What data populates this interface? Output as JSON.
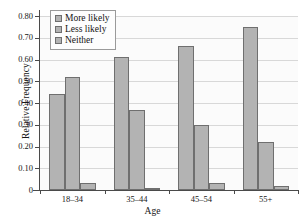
{
  "chart_data": {
    "type": "bar",
    "title": "",
    "xlabel": "Age",
    "ylabel": "Relative Frequency",
    "categories": [
      "18–34",
      "35–44",
      "45–54",
      "55+"
    ],
    "series": [
      {
        "name": "More likely",
        "values": [
          0.44,
          0.61,
          0.66,
          0.75
        ]
      },
      {
        "name": "Less likely",
        "values": [
          0.52,
          0.37,
          0.3,
          0.22
        ]
      },
      {
        "name": "Neither",
        "values": [
          0.03,
          0.01,
          0.03,
          0.02
        ]
      }
    ],
    "ylim": [
      0,
      0.8
    ],
    "yticks": [
      0,
      0.1,
      0.2,
      0.3,
      0.4,
      0.5,
      0.6,
      0.7,
      0.8
    ],
    "ytick_labels": [
      "0",
      "0.10",
      "0.20",
      "0.30",
      "0.40",
      "0.50",
      "0.60",
      "0.70",
      "0.80"
    ],
    "grid": true,
    "legend_position": "top-left",
    "bar_color": "#b3b3b3",
    "bar_border_color": "#6f6f6f",
    "grid_color": "#d8d8d8",
    "axis_color": "#4a4a4a"
  },
  "legend": {
    "items": [
      {
        "label": "More likely"
      },
      {
        "label": "Less likely"
      },
      {
        "label": "Neither"
      }
    ]
  },
  "axes": {
    "y_title": "Relative Frequency",
    "x_title": "Age"
  }
}
